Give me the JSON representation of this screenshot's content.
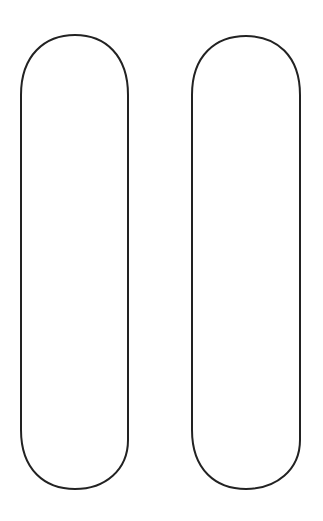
{
  "figure": {
    "stroke_color": "#222222",
    "background_color": "#ffffff",
    "shapes": [
      {
        "name": "left-bar",
        "x": 21,
        "y": 35,
        "width": 107,
        "height": 454,
        "radius": 53
      },
      {
        "name": "right-bar",
        "x": 192,
        "y": 36,
        "width": 108,
        "height": 453,
        "radius": 54
      }
    ]
  }
}
